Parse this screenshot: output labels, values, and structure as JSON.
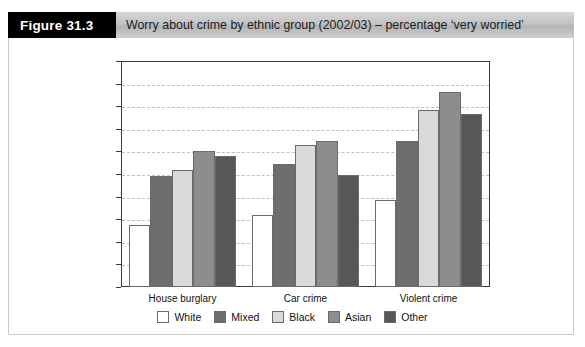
{
  "figure": {
    "tag": "Figure 31.3",
    "title": "Worry about crime by ethnic group (2002/03) – percentage ‘very worried’"
  },
  "chart_data": {
    "type": "bar",
    "title": "Worry about crime by ethnic group (2002/03) – percentage ‘very worried’",
    "xlabel": "",
    "ylabel": "",
    "ylim": [
      0,
      50
    ],
    "yticks": [
      0,
      5,
      10,
      15,
      20,
      25,
      30,
      35,
      40,
      45,
      50
    ],
    "grid": true,
    "legend_position": "bottom",
    "categories": [
      "House burglary",
      "Car crime",
      "Violent crime"
    ],
    "series": [
      {
        "name": "White",
        "color": "#ffffff",
        "values": [
          13.8,
          16.0,
          19.3
        ]
      },
      {
        "name": "Mixed",
        "color": "#6e6e6e",
        "values": [
          24.5,
          27.3,
          32.3
        ]
      },
      {
        "name": "Black",
        "color": "#d9d9d9",
        "values": [
          25.9,
          31.5,
          39.2
        ]
      },
      {
        "name": "Asian",
        "color": "#8d8d8d",
        "values": [
          30.1,
          32.3,
          43.2
        ]
      },
      {
        "name": "Other",
        "color": "#575757",
        "values": [
          28.9,
          24.8,
          38.2
        ]
      }
    ]
  }
}
